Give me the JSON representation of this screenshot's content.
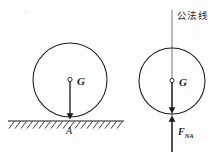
{
  "figure": {
    "background_color": "#fdfdfd",
    "ink_color": "#1d1d1d",
    "left_diagram": {
      "circle": {
        "cx": 70,
        "cy": 80,
        "r": 37
      },
      "weight_vector": {
        "label": "G",
        "label_x": 77,
        "label_y": 82,
        "from_x": 70,
        "from_y": 80,
        "to_x": 70,
        "to_y": 121,
        "direction": "down"
      },
      "center_marker": {
        "cx": 70,
        "cy": 80,
        "r": 2.2
      },
      "ground": {
        "line_x1": 8,
        "line_y1": 121,
        "line_x2": 124,
        "line_y2": 121,
        "hatch_count": 19,
        "hatch_length": 8
      },
      "contact_point_label": {
        "text": "A",
        "x": 67,
        "y": 130
      }
    },
    "right_diagram": {
      "circle": {
        "cx": 172,
        "cy": 81,
        "r": 33
      },
      "normal_line": {
        "label": "公法线",
        "label_x": 178,
        "label_y": 15,
        "x": 172,
        "y_top": 10,
        "y_bottom": 152
      },
      "center_marker": {
        "cx": 172,
        "cy": 81,
        "r": 2.2
      },
      "weight_vector": {
        "label": "G",
        "label_x": 179,
        "label_y": 83,
        "from_x": 172,
        "from_y": 81,
        "to_x": 172,
        "to_y": 114,
        "direction": "down"
      },
      "normal_force_vector": {
        "label_base": "F",
        "label_sub": "NA",
        "label_x": 178,
        "label_y": 131,
        "from_x": 172,
        "from_y": 152,
        "to_x": 172,
        "to_y": 115,
        "direction": "up"
      }
    }
  }
}
